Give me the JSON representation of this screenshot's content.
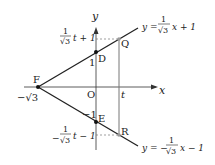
{
  "figure": {
    "axes": {
      "x_label": "x",
      "y_label": "y",
      "origin_label": "O"
    },
    "points": {
      "F": {
        "label": "F",
        "value_label": "−√3"
      },
      "D": {
        "label": "D",
        "value_label": "1"
      },
      "E": {
        "label": "E",
        "value_label": "−1"
      },
      "Q": {
        "label": "Q"
      },
      "R": {
        "label": "R"
      }
    },
    "tick_t": "t",
    "lines": {
      "upper": {
        "prefix": "y =",
        "num": "1",
        "den": "√3",
        "suffix": "x + 1"
      },
      "lower": {
        "prefix": "y = −",
        "num": "1",
        "den": "√3",
        "suffix": "x − 1"
      }
    },
    "q_value": {
      "num": "1",
      "den": "√3",
      "suffix": "t + 1"
    },
    "r_value": {
      "prefix": "−",
      "num": "1",
      "den": "√3",
      "suffix": "t − 1"
    },
    "colors": {
      "line": "#222222",
      "gray_line": "#777777",
      "point": "#111111",
      "gray_point": "#999999"
    }
  }
}
